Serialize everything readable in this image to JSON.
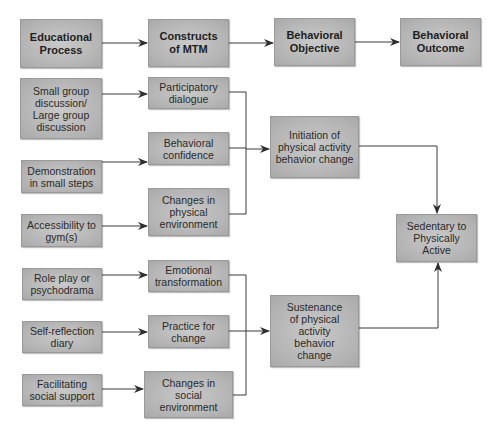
{
  "header_row": [
    {
      "id": "educational-process",
      "label": "Educational Process"
    },
    {
      "id": "constructs-of-mtm",
      "label": "Constructs of MTM"
    },
    {
      "id": "behavioral-objective",
      "label": "Behavioral Objective"
    },
    {
      "id": "behavioral-outcome",
      "label": "Behavioral Outcome"
    }
  ],
  "educational_processes": [
    {
      "id": "small-group",
      "label": "Small group discussion/ Large group discussion"
    },
    {
      "id": "demonstration",
      "label": "Demonstration in small steps"
    },
    {
      "id": "accessibility",
      "label": "Accessibility to gym(s)"
    },
    {
      "id": "role-play",
      "label": "Role play or psychodrama"
    },
    {
      "id": "self-reflection",
      "label": "Self-reflection diary"
    },
    {
      "id": "facilitating",
      "label": "Facilitating social support"
    }
  ],
  "constructs": [
    {
      "id": "participatory-dialogue",
      "label": "Participatory dialogue"
    },
    {
      "id": "behavioral-confidence",
      "label": "Behavioral confidence"
    },
    {
      "id": "changes-physical",
      "label": "Changes in physical environment"
    },
    {
      "id": "emotional-transformation",
      "label": "Emotional transformation"
    },
    {
      "id": "practice-for-change",
      "label": "Practice for change"
    },
    {
      "id": "changes-social",
      "label": "Changes in social environment"
    }
  ],
  "objectives": [
    {
      "id": "initiation",
      "label": "Initiation of physical activity behavior change"
    },
    {
      "id": "sustenance",
      "label": "Sustenance of physical activity behavior change"
    }
  ],
  "outcome": {
    "id": "sedentary-to-active",
    "label": "Sedentary to Physically Active"
  },
  "colors": {
    "box_fill": "#b8b8b8",
    "box_border": "#9a9a9a",
    "line": "#333333",
    "text": "#2a2a2a"
  }
}
